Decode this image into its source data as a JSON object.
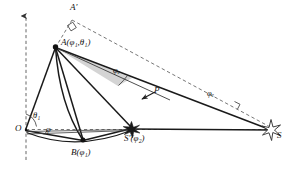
{
  "figure": {
    "background_color": "#ffffff",
    "stroke_color": "#1a1a1a",
    "dashed_color": "#555555",
    "shade_color": "#d0d0d0",
    "width": 289,
    "height": 169
  },
  "points": {
    "origin": {
      "name": "O",
      "label": "O",
      "x": 24,
      "y": 129
    },
    "a": {
      "name": "A",
      "label": "A(φ₁,θ₁)",
      "label_base": "A(",
      "x": 55,
      "y": 47
    },
    "a_prime": {
      "name": "A'",
      "label": "A′",
      "x": 76,
      "y": 12
    },
    "b": {
      "name": "B",
      "label": "B(φ₁)",
      "x": 83,
      "y": 146
    },
    "s_prime": {
      "name": "S'",
      "label": "S′(φ₂)",
      "x": 133,
      "y": 131
    },
    "s": {
      "name": "S",
      "label": "S",
      "x": 275,
      "y": 131
    },
    "p": {
      "name": "P",
      "label": "P",
      "x": 156,
      "y": 93
    }
  },
  "angles": {
    "theta1": {
      "label": "θ₁",
      "symbol": "θ",
      "subscript": "1"
    },
    "phi": {
      "label": "φ",
      "symbol": "φ",
      "subscript": ""
    },
    "phi_e_upper": {
      "label": "φₑ",
      "symbol": "φ",
      "subscript": "e"
    },
    "phi_e_lower": {
      "label": "φₑ",
      "symbol": "φ",
      "subscript": "e"
    }
  },
  "markers": {
    "right_angle_top": "right-angle-square",
    "right_angle_lower": "right-angle-tick",
    "star_s": "star-outline",
    "star_s_prime": "star-filled",
    "vertical_axis_arrow": "arrow-up",
    "p_arrow": "arrow-down-left"
  }
}
